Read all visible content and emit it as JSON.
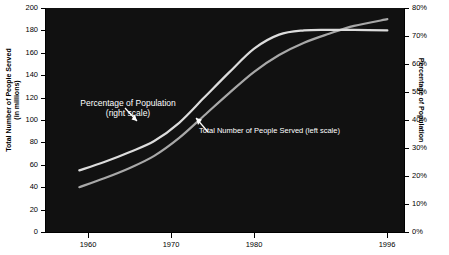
{
  "chart_data": {
    "type": "line",
    "title": "",
    "xlabel": "",
    "ylabel": "Total Number of People Served\n(in millions)",
    "y2label": "Percentage of Population",
    "xlim": [
      1955,
      1998
    ],
    "ylim": [
      0,
      200
    ],
    "y2lim": [
      0,
      80
    ],
    "grid": false,
    "legend": "annotations-inline",
    "background": "#111111",
    "x_ticks": [
      "1960",
      "1970",
      "1980",
      "1996"
    ],
    "x_tick_values": [
      1960,
      1970,
      1980,
      1996
    ],
    "y_ticks_left": [
      "0",
      "20",
      "40",
      "60",
      "80",
      "100",
      "120",
      "140",
      "160",
      "180",
      "200"
    ],
    "y_tick_values_left": [
      0,
      20,
      40,
      60,
      80,
      100,
      120,
      140,
      160,
      180,
      200
    ],
    "y_ticks_right": [
      "0%",
      "10%",
      "20%",
      "30%",
      "40%",
      "50%",
      "60%",
      "70%",
      "80%"
    ],
    "y_tick_values_right": [
      0,
      10,
      20,
      30,
      40,
      50,
      60,
      70,
      80
    ],
    "series": [
      {
        "name": "Percentage of Population (right scale)",
        "axis": "right",
        "color": "#dcdcdc",
        "x": [
          1959,
          1962,
          1965,
          1968,
          1971,
          1974,
          1977,
          1980,
          1983,
          1986,
          1989,
          1992,
          1996
        ],
        "values": [
          22.0,
          25.0,
          28.5,
          32.5,
          39.0,
          48.0,
          57.0,
          65.5,
          70.5,
          72.0,
          72.2,
          72.2,
          72.0
        ]
      },
      {
        "name": "Total Number of People Served (left scale)",
        "axis": "left",
        "color": "#a8a8a8",
        "x": [
          1959,
          1962,
          1965,
          1968,
          1971,
          1974,
          1977,
          1980,
          1983,
          1986,
          1989,
          1992,
          1996
        ],
        "values": [
          40,
          48,
          57,
          68,
          84,
          104,
          124,
          143,
          158,
          169,
          177,
          184,
          190
        ]
      }
    ],
    "annotations": [
      {
        "name": "percentage-annotation",
        "text": "Percentage of Population\n(right scale)",
        "color": "#ffffff"
      },
      {
        "name": "total-served-annotation",
        "text": "Total Number of People Served (left scale)",
        "color": "#ffffff"
      }
    ]
  },
  "axes": {
    "left_title": "Total Number of People Served\n(in millions)",
    "right_title": "Percentage of Population"
  },
  "truncated_header": ""
}
